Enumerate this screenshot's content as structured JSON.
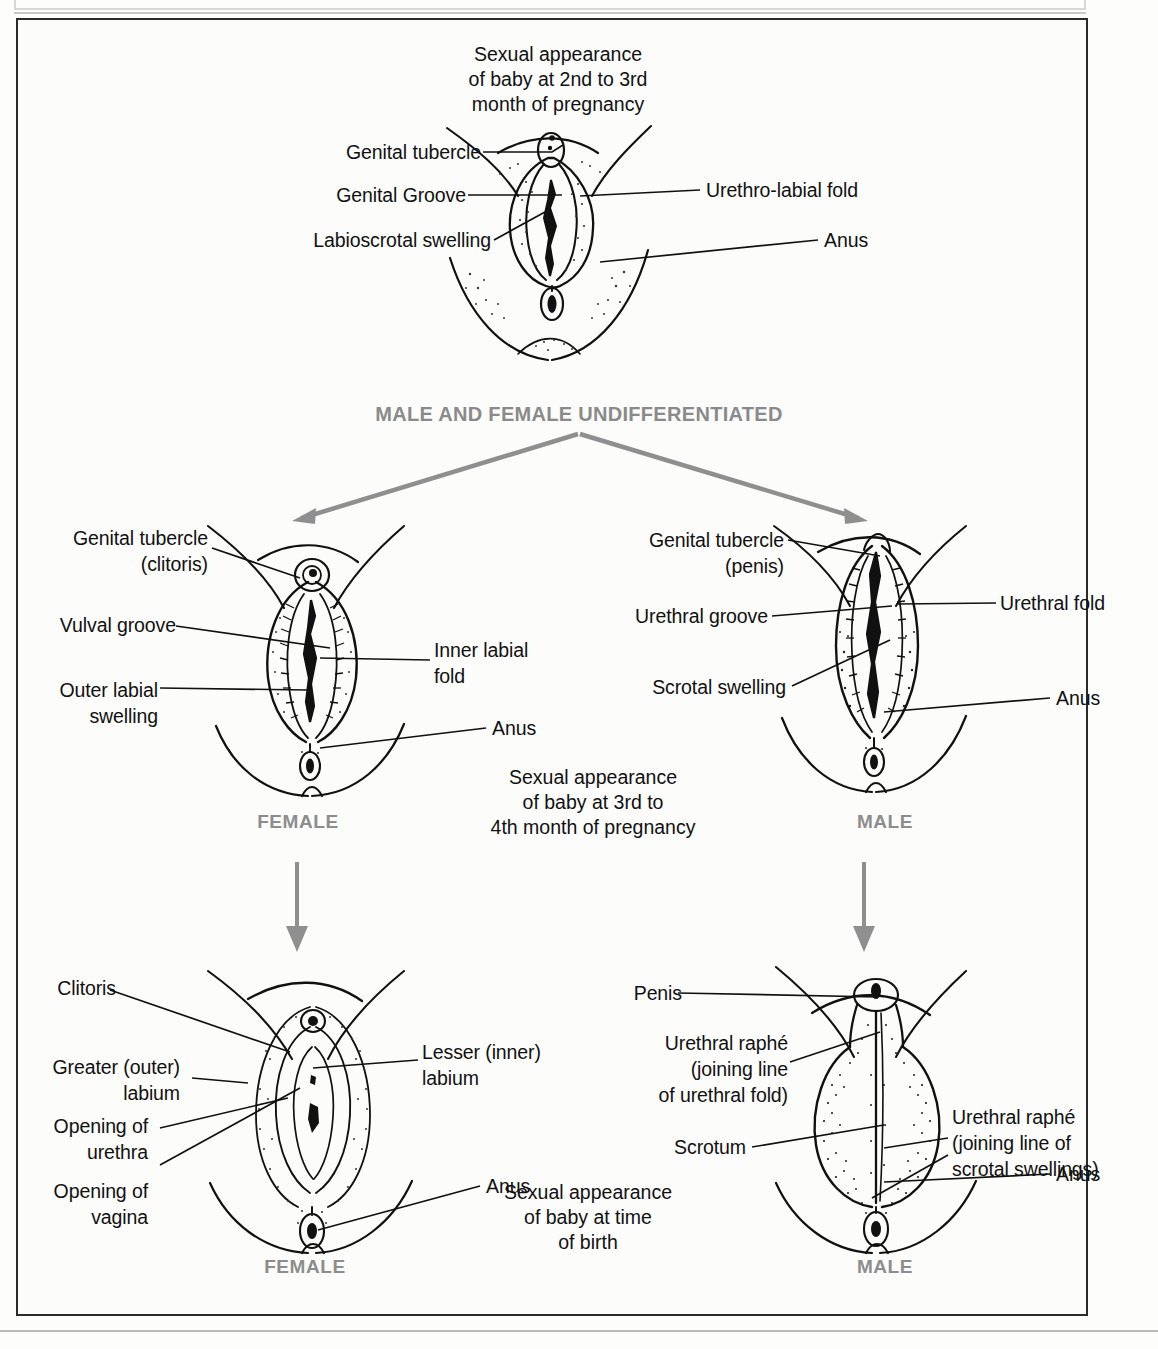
{
  "page": {
    "section_heading": "MALE AND FEMALE UNDIFFERENTIATED"
  },
  "captions": {
    "stage1": "Sexual appearance\nof baby at 2nd to 3rd\nmonth of pregnancy",
    "stage2": "Sexual appearance\nof baby at 3rd to\n4th month of pregnancy",
    "stage3": "Sexual appearance\nof baby at time\nof birth"
  },
  "stage_labels": {
    "female": "FEMALE",
    "male": "MALE"
  },
  "figures": {
    "undifferentiated": {
      "name": "undifferentiated-genitalia",
      "labels_left": [
        "Genital tubercle",
        "Genital Groove",
        "Labioscrotal swelling"
      ],
      "labels_right": [
        "Urethro-labial fold",
        "Anus"
      ]
    },
    "female_mid": {
      "name": "female-genitalia-3rd-to-4th-month",
      "labels_left": [
        "Genital tubercle\n(clitoris)",
        "Vulval groove",
        "Outer labial\nswelling"
      ],
      "labels_right": [
        "Inner labial\nfold",
        "Anus"
      ]
    },
    "male_mid": {
      "name": "male-genitalia-3rd-to-4th-month",
      "labels_left": [
        "Genital tubercle\n(penis)",
        "Urethral groove",
        "Scrotal swelling"
      ],
      "labels_right": [
        "Urethral fold",
        "Anus"
      ]
    },
    "female_birth": {
      "name": "female-genitalia-at-birth",
      "labels_left": [
        "Clitoris",
        "Greater (outer)\nlabium",
        "Opening of\nurethra",
        "Opening of\nvagina"
      ],
      "labels_right": [
        "Lesser (inner)\nlabium",
        "Anus"
      ]
    },
    "male_birth": {
      "name": "male-genitalia-at-birth",
      "labels_left": [
        "Penis",
        "Urethral raphé\n(joining line\nof urethral fold)",
        "Scrotum"
      ],
      "labels_right": [
        "Urethral raphé\n(joining line of\nscrotal swellings)",
        "Anus"
      ]
    }
  },
  "colors": {
    "ink": "#111111",
    "gray_accent": "#8a8a8a",
    "frame": "#2b2b2b",
    "background": "#fcfcfb"
  },
  "arrows": {
    "branch_left": "arrow-to-female",
    "branch_right": "arrow-to-male",
    "down_left": "arrow-female-to-birth",
    "down_right": "arrow-male-to-birth"
  }
}
